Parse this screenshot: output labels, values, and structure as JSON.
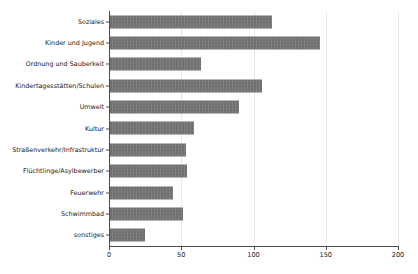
{
  "chart_data": {
    "type": "bar",
    "orientation": "horizontal",
    "title": "",
    "subtitle": "",
    "xlabel": "",
    "ylabel": "",
    "xlim": [
      0,
      200
    ],
    "ylim": [
      0,
      11
    ],
    "grid": true,
    "grid_axis": "x",
    "legend": null,
    "legend_position": "none",
    "bar_color": "#6e6e6e",
    "axis_color": "#4d4d4d",
    "grid_color": "#e9e9e9",
    "background": "#ffffff",
    "categories": [
      "Soziales",
      "Kinder und Jugend",
      "Ordnung und Sauberkeit",
      "Kindertagesstätten/Schulen",
      "Umwelt",
      "Kultur",
      "Straßenverkehr/Infrastruktur",
      "Flüchtlinge/Asylbewerber",
      "Feuerwehr",
      "Schwimmbad",
      "sonstiges"
    ],
    "values": [
      113,
      146,
      64,
      106,
      90,
      59,
      53,
      54,
      44,
      51,
      25
    ],
    "xticks": [
      0,
      50,
      100,
      150,
      200
    ],
    "xticklabels": [
      "0",
      "50",
      "100",
      "150",
      "200"
    ],
    "annotations": []
  }
}
